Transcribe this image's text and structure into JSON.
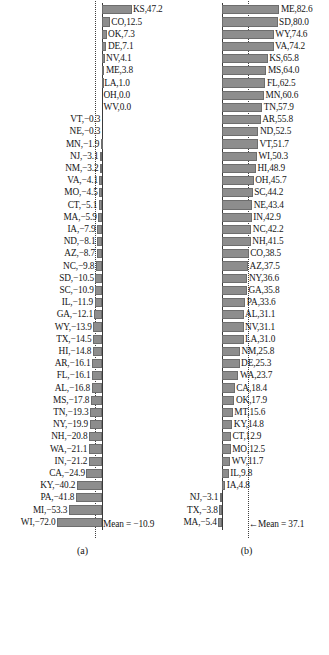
{
  "figure": {
    "panel_a_letter": "(a)",
    "panel_b_letter": "(b)",
    "panel_a_mean_label": "Mean = −10.9",
    "panel_b_mean_label": "←Mean = 37.1",
    "bar_color": "#8d8d8d",
    "bar_border_color": "#6d6d6d",
    "axis_color": "#3a3a3a",
    "mean_line_color": "#3f3f3f",
    "caption": ""
  },
  "chart_data": [
    {
      "type": "bar",
      "id": "panel-a",
      "title": "(a)",
      "orientation": "horizontal",
      "grid": false,
      "legend": null,
      "xlabel": "",
      "ylabel": "",
      "mean": -10.9,
      "mean_annotation": "Mean = −10.9",
      "xlim": [
        -72.0,
        47.2
      ],
      "categories": [
        "KS",
        "CO",
        "OK",
        "DE",
        "NV",
        "ME",
        "LA",
        "OH",
        "WV",
        "VT",
        "NE",
        "MN",
        "NJ",
        "NM",
        "VA",
        "MO",
        "CT",
        "MA",
        "IA",
        "ND",
        "AZ",
        "NC",
        "SD",
        "SC",
        "IL",
        "GA",
        "WY",
        "TX",
        "HI",
        "AR",
        "FL",
        "AL",
        "MS",
        "TN",
        "NY",
        "NH",
        "WA",
        "IN",
        "CA",
        "KY",
        "PA",
        "MI",
        "WI"
      ],
      "values": [
        47.2,
        12.5,
        7.3,
        7.1,
        4.1,
        3.8,
        1.0,
        0.0,
        0.0,
        -0.3,
        -0.3,
        -1.9,
        -3.1,
        -3.2,
        -4.1,
        -4.5,
        -5.1,
        -5.9,
        -7.9,
        -8.1,
        -8.7,
        -9.8,
        -10.5,
        -10.9,
        -11.9,
        -12.1,
        -13.9,
        -14.5,
        -14.8,
        -16.1,
        -16.1,
        -16.8,
        -17.8,
        -19.3,
        -19.9,
        -20.8,
        -21.1,
        -21.2,
        -24.9,
        -40.2,
        -41.8,
        -53.3,
        -72.0
      ],
      "labels": [
        "KS,47.2",
        "CO,12.5",
        "OK,7.3",
        "DE,7.1",
        "NV,4.1",
        "ME,3.8",
        "LA,1.0",
        "OH,0.0",
        "WV,0.0",
        "VT,−0.3",
        "NE,−0.3",
        "MN,−1.9",
        "NJ,−3.1",
        "NM,−3.2",
        "VA,−4.1",
        "MO,−4.5",
        "CT,−5.1",
        "MA,−5.9",
        "IA,−7.9",
        "ND,−8.1",
        "AZ,−8.7",
        "NC,−9.8",
        "SD,−10.5",
        "SC,−10.9",
        "IL,−11.9",
        "GA,−12.1",
        "WY,−13.9",
        "TX,−14.5",
        "HI,−14.8",
        "AR,−16.1",
        "FL,−16.1",
        "AL,−16.8",
        "MS,−17.8",
        "TN,−19.3",
        "NY,−19.9",
        "NH,−20.8",
        "WA,−21.1",
        "IN,−21.2",
        "CA,−24.9",
        "KY,−40.2",
        "PA,−41.8",
        "MI,−53.3",
        "WI,−72.0"
      ]
    },
    {
      "type": "bar",
      "id": "panel-b",
      "title": "(b)",
      "orientation": "horizontal",
      "grid": false,
      "legend": null,
      "xlabel": "",
      "ylabel": "",
      "mean": 37.1,
      "mean_annotation": "←Mean = 37.1",
      "xlim": [
        -5.4,
        82.6
      ],
      "categories": [
        "ME",
        "SD",
        "WY",
        "VA",
        "KS",
        "MS",
        "FL",
        "MN",
        "TN",
        "AR",
        "ND",
        "VT",
        "WI",
        "HI",
        "OH",
        "SC",
        "NE",
        "IN",
        "NC",
        "NH",
        "CO",
        "AZ",
        "NY",
        "GA",
        "PA",
        "AL",
        "NV",
        "LA",
        "NM",
        "DE",
        "WA",
        "CA",
        "OK",
        "MT",
        "KY",
        "CT",
        "MO",
        "WV",
        "IL",
        "IA",
        "NJ",
        "TX",
        "MA"
      ],
      "values": [
        82.6,
        80.0,
        74.6,
        74.2,
        65.8,
        64.0,
        62.5,
        60.6,
        57.9,
        55.8,
        52.5,
        51.7,
        50.3,
        48.9,
        45.7,
        44.2,
        43.4,
        42.9,
        42.2,
        41.5,
        38.5,
        37.5,
        36.6,
        35.8,
        33.6,
        31.1,
        31.1,
        31.0,
        25.8,
        25.3,
        23.7,
        18.4,
        17.9,
        15.6,
        14.8,
        12.9,
        12.5,
        11.7,
        9.8,
        4.8,
        -3.1,
        -3.8,
        -5.4
      ],
      "labels": [
        "ME,82.6",
        "SD,80.0",
        "WY,74.6",
        "VA,74.2",
        "KS,65.8",
        "MS,64.0",
        "FL,62.5",
        "MN,60.6",
        "TN,57.9",
        "AR,55.8",
        "ND,52.5",
        "VT,51.7",
        "WI,50.3",
        "HI,48.9",
        "OH,45.7",
        "SC,44.2",
        "NE,43.4",
        "IN,42.9",
        "NC,42.2",
        "NH,41.5",
        "CO,38.5",
        "AZ,37.5",
        "NY,36.6",
        "GA,35.8",
        "PA,33.6",
        "AL,31.1",
        "NV,31.1",
        "LA,31.0",
        "NM,25.8",
        "DE,25.3",
        "WA,23.7",
        "CA,18.4",
        "OK,17.9",
        "MT,15.6",
        "KY,14.8",
        "CT,12.9",
        "MO,12.5",
        "WV,11.7",
        "IL,9.8",
        "IA,4.8",
        "NJ,−3.1",
        "TX,−3.8",
        "MA,−5.4"
      ]
    }
  ]
}
